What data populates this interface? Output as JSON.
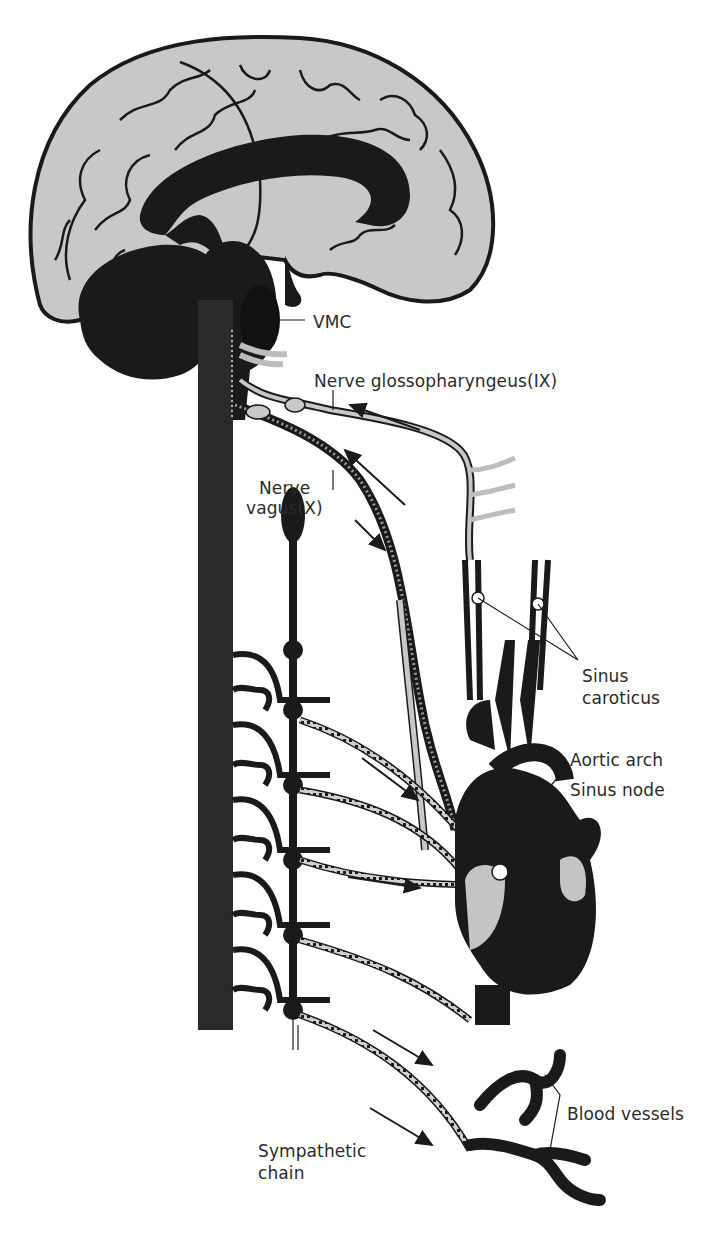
{
  "figure": {
    "colors": {
      "ink": "#1a1a1a",
      "brain_fill": "#c8c8c8",
      "nerve_gray": "#bdbdbd",
      "heart_highlight": "#c4c4c4",
      "background": "#ffffff"
    }
  },
  "labels": {
    "vmc": "VMC",
    "glossopharyngeus": "Nerve glossopharyngeus(IX)",
    "vagus_line1": "Nerve",
    "vagus_line2": "vagus(X)",
    "sinus_caroticus_line1": "Sinus",
    "sinus_caroticus_line2": "caroticus",
    "aortic_arch": "Aortic arch",
    "sinus_node": "Sinus node",
    "blood_vessels": "Blood vessels",
    "sympathetic_line1": "Sympathetic",
    "sympathetic_line2": "chain"
  }
}
